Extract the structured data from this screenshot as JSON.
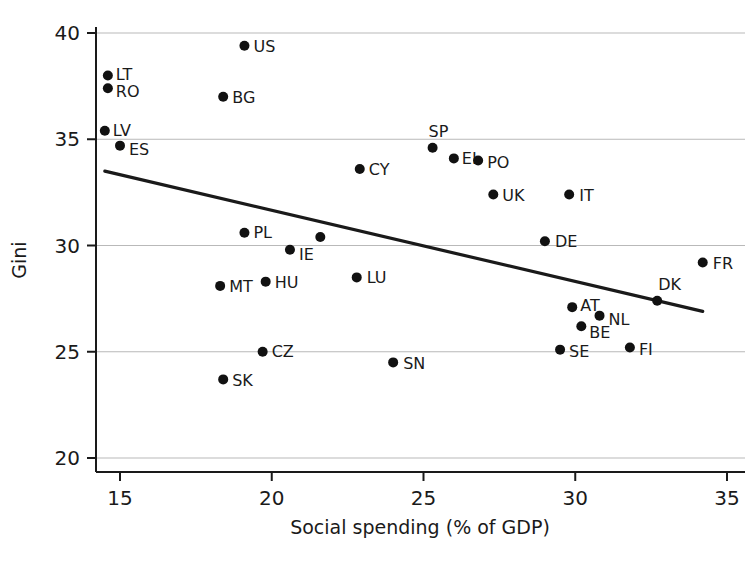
{
  "chart_data": {
    "type": "scatter",
    "title": "",
    "xlabel": "Social spending (% of GDP)",
    "ylabel": "Gini",
    "xlim": [
      14.2,
      35.4
    ],
    "ylim": [
      19.3,
      40.6
    ],
    "xticks": [
      15,
      20,
      25,
      30,
      35
    ],
    "xtick_labels": [
      "15",
      "20",
      "25",
      "30",
      "35"
    ],
    "yticks": [
      20,
      25,
      30,
      35,
      40
    ],
    "ytick_labels": [
      "20",
      "25",
      "30",
      "35",
      "40"
    ],
    "grid": "horizontal",
    "legend": "none",
    "points": [
      {
        "label": "US",
        "x": 19.1,
        "y": 39.4,
        "label_dx": 9,
        "label_dy": 6
      },
      {
        "label": "LT",
        "x": 14.6,
        "y": 38.0,
        "label_dx": 8,
        "label_dy": 4
      },
      {
        "label": "RO",
        "x": 14.6,
        "y": 37.4,
        "label_dx": 8,
        "label_dy": 9
      },
      {
        "label": "BG",
        "x": 18.4,
        "y": 37.0,
        "label_dx": 9,
        "label_dy": 6
      },
      {
        "label": "LV",
        "x": 14.5,
        "y": 35.4,
        "label_dx": 8,
        "label_dy": 5
      },
      {
        "label": "ES",
        "x": 15.0,
        "y": 34.7,
        "label_dx": 9,
        "label_dy": 9
      },
      {
        "label": "SP",
        "x": 25.3,
        "y": 34.6,
        "label_dx": -4,
        "label_dy": -11
      },
      {
        "label": "EL",
        "x": 26.0,
        "y": 34.1,
        "label_dx": 8,
        "label_dy": 6
      },
      {
        "label": "PO",
        "x": 26.8,
        "y": 34.0,
        "label_dx": 9,
        "label_dy": 7
      },
      {
        "label": "CY",
        "x": 22.9,
        "y": 33.6,
        "label_dx": 9,
        "label_dy": 6
      },
      {
        "label": "IT",
        "x": 29.8,
        "y": 32.4,
        "label_dx": 10,
        "label_dy": 6
      },
      {
        "label": "UK",
        "x": 27.3,
        "y": 32.4,
        "label_dx": 9,
        "label_dy": 6
      },
      {
        "label": "PL",
        "x": 19.1,
        "y": 30.6,
        "label_dx": 9,
        "label_dy": 5
      },
      {
        "label": "",
        "x": 21.6,
        "y": 30.4,
        "label_dx": 0,
        "label_dy": 0
      },
      {
        "label": "DE",
        "x": 29.0,
        "y": 30.2,
        "label_dx": 10,
        "label_dy": 6
      },
      {
        "label": "IE",
        "x": 20.6,
        "y": 29.8,
        "label_dx": 9,
        "label_dy": 10
      },
      {
        "label": "FR",
        "x": 34.2,
        "y": 29.2,
        "label_dx": 10,
        "label_dy": 6
      },
      {
        "label": "LU",
        "x": 22.8,
        "y": 28.5,
        "label_dx": 10,
        "label_dy": 6
      },
      {
        "label": "HU",
        "x": 19.8,
        "y": 28.3,
        "label_dx": 9,
        "label_dy": 6
      },
      {
        "label": "MT",
        "x": 18.3,
        "y": 28.1,
        "label_dx": 9,
        "label_dy": 6
      },
      {
        "label": "DK",
        "x": 32.7,
        "y": 27.4,
        "label_dx": 1,
        "label_dy": -11
      },
      {
        "label": "AT",
        "x": 29.9,
        "y": 27.1,
        "label_dx": 8,
        "label_dy": 4
      },
      {
        "label": "NL",
        "x": 30.8,
        "y": 26.7,
        "label_dx": 9,
        "label_dy": 9
      },
      {
        "label": "BE",
        "x": 30.2,
        "y": 26.2,
        "label_dx": 8,
        "label_dy": 12
      },
      {
        "label": "FI",
        "x": 31.8,
        "y": 25.2,
        "label_dx": 9,
        "label_dy": 7
      },
      {
        "label": "SE",
        "x": 29.5,
        "y": 25.1,
        "label_dx": 9,
        "label_dy": 7
      },
      {
        "label": "CZ",
        "x": 19.7,
        "y": 25.0,
        "label_dx": 9,
        "label_dy": 5
      },
      {
        "label": "SN",
        "x": 24.0,
        "y": 24.5,
        "label_dx": 10,
        "label_dy": 7
      },
      {
        "label": "SK",
        "x": 18.4,
        "y": 23.7,
        "label_dx": 9,
        "label_dy": 7
      }
    ],
    "trendline": {
      "x0": 14.5,
      "y0": 33.5,
      "x1": 34.2,
      "y1": 26.9
    }
  }
}
